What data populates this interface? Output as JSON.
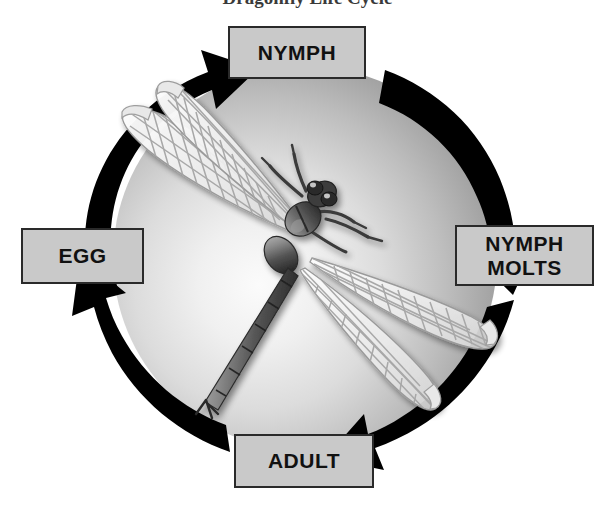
{
  "title": "Dragonfly Life Cycle",
  "diagram": {
    "type": "cycle",
    "direction": "counterclockwise",
    "center_subject": "dragonfly-illustration",
    "stages": [
      {
        "id": "nymph",
        "label": "NYMPH",
        "position": "top"
      },
      {
        "id": "nymph_molts",
        "label_line1": "NYMPH",
        "label_line2": "MOLTS",
        "position": "right"
      },
      {
        "id": "adult",
        "label": "ADULT",
        "position": "bottom"
      },
      {
        "id": "egg",
        "label": "EGG",
        "position": "left"
      }
    ],
    "arrows": [
      {
        "id": "egg-to-nymph",
        "from": "egg",
        "to": "nymph",
        "position": "top-left"
      },
      {
        "id": "nymph-to-molts",
        "from": "nymph",
        "to": "nymph_molts",
        "position": "top-right"
      },
      {
        "id": "molts-to-adult",
        "from": "nymph_molts",
        "to": "adult",
        "position": "bottom-right"
      },
      {
        "id": "adult-to-egg",
        "from": "adult",
        "to": "egg",
        "position": "bottom-left"
      }
    ]
  },
  "colors": {
    "arrow": "#000000",
    "box_fill": "#c9c9c9",
    "box_border": "#2a2a2a",
    "text": "#111111",
    "sphere_light": "#f2f2f2",
    "sphere_dark": "#8c8c8c",
    "background": "#ffffff"
  }
}
